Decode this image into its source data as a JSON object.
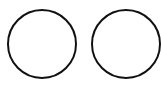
{
  "diagram": {
    "background": "#ffffff",
    "shapes": [
      {
        "type": "circle",
        "cx": 42,
        "cy": 43.5,
        "diameter": 70,
        "stroke": "#111111",
        "stroke_width": 2,
        "fill": "none"
      },
      {
        "type": "circle",
        "cx": 125.5,
        "cy": 43.5,
        "diameter": 70,
        "stroke": "#111111",
        "stroke_width": 2,
        "fill": "none"
      }
    ]
  }
}
